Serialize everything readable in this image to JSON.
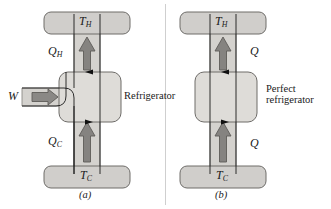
{
  "figure": {
    "type": "thermodynamics-refrigerator-diagram",
    "background_color": "#ffffff",
    "band_color": "#d4d2ce",
    "band_edge_color": "#8d8b87",
    "arrow_color": "#858380",
    "arrow_edge_color": "#5d5b58",
    "reservoir_color": "#d0cecb",
    "reservoir_edge_color": "#6e6c69",
    "box_color": "#dedcd8",
    "box_edge_color": "#6e6c69",
    "line_color": "#1a1a1a",
    "divider_color": "#cfcfcf"
  },
  "panels": [
    {
      "id": "a",
      "caption": "(a)",
      "device_name": "Refrigerator",
      "device_name_lines": [
        "Refrigerator"
      ],
      "hot_reservoir": {
        "symbol": "T",
        "subscript": "H"
      },
      "cold_reservoir": {
        "symbol": "T",
        "subscript": "C"
      },
      "heat_out": {
        "symbol": "Q",
        "subscript": "H",
        "direction": "up"
      },
      "heat_in": {
        "symbol": "Q",
        "subscript": "C",
        "direction": "up"
      },
      "work_input": {
        "symbol": "W",
        "subscript": "",
        "direction": "right"
      },
      "has_work_input": true
    },
    {
      "id": "b",
      "caption": "(b)",
      "device_name": "Perfect refrigerator",
      "device_name_lines": [
        "Perfect",
        "refrigerator"
      ],
      "hot_reservoir": {
        "symbol": "T",
        "subscript": "H"
      },
      "cold_reservoir": {
        "symbol": "T",
        "subscript": "C"
      },
      "heat_out": {
        "symbol": "Q",
        "subscript": "",
        "direction": "up"
      },
      "heat_in": {
        "symbol": "Q",
        "subscript": "",
        "direction": "up"
      },
      "work_input": null,
      "has_work_input": false
    }
  ]
}
